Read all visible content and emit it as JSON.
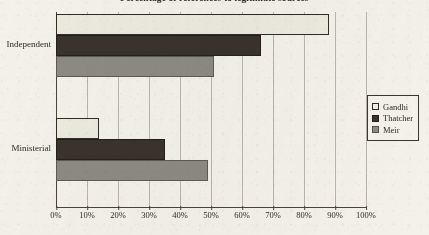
{
  "chart_data": {
    "type": "bar",
    "orientation": "horizontal",
    "title": "Percentage of references to legitimate sources",
    "categories": [
      "Independent",
      "Ministerial"
    ],
    "series": [
      {
        "name": "Gandhi",
        "color": "#eceade",
        "values": [
          88,
          14
        ]
      },
      {
        "name": "Thatcher",
        "color": "#3a332c",
        "values": [
          66,
          35
        ]
      },
      {
        "name": "Meir",
        "color": "#8d8a81",
        "values": [
          51,
          49
        ]
      }
    ],
    "xlabel": "",
    "ylabel": "",
    "xlim": [
      0,
      100
    ],
    "xticks": [
      "0%",
      "10%",
      "20%",
      "30%",
      "40%",
      "50%",
      "60%",
      "70%",
      "80%",
      "90%",
      "100%"
    ],
    "xtick_values": [
      0,
      10,
      20,
      30,
      40,
      50,
      60,
      70,
      80,
      90,
      100
    ],
    "grid": true,
    "legend_position": "right"
  },
  "legend": {
    "items": [
      {
        "label": "Gandhi",
        "swatch": "gandhi-swatch"
      },
      {
        "label": "Thatcher",
        "swatch": "thatcher-swatch"
      },
      {
        "label": "Meir",
        "swatch": "meir-swatch"
      }
    ]
  }
}
